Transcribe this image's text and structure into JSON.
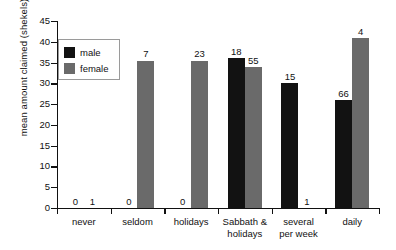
{
  "chart_data": {
    "type": "bar",
    "title": "",
    "xlabel": "",
    "ylabel": "mean amount claimed (shekels)",
    "ylim": [
      0,
      45
    ],
    "ytick_step": 5,
    "yticks": [
      45,
      40,
      35,
      30,
      25,
      20,
      15,
      10,
      5,
      0
    ],
    "grid": false,
    "legend_position": "inside-top-left",
    "categories": [
      "never",
      "seldom",
      "holidays",
      "Sabbath & holidays",
      "several per week",
      "daily"
    ],
    "series": [
      {
        "name": "male",
        "color": "#121212",
        "values": [
          0,
          0,
          0,
          36,
          30,
          26
        ],
        "labels": [
          "0",
          "0",
          "0",
          "18",
          "15",
          "66"
        ]
      },
      {
        "name": "female",
        "color": "#6a6a6a",
        "values": [
          0,
          35.5,
          35.5,
          34,
          0,
          41
        ],
        "labels": [
          "1",
          "7",
          "23",
          "55",
          "1",
          "4"
        ]
      }
    ]
  },
  "legend": {
    "items": [
      {
        "label": "male",
        "swatch": "male"
      },
      {
        "label": "female",
        "swatch": "female"
      }
    ]
  },
  "axis": {
    "y_title": "mean amount claimed (shekels)",
    "y_labels": [
      "45",
      "40",
      "35",
      "30",
      "25",
      "20",
      "15",
      "10",
      "5",
      "0"
    ],
    "x_labels": [
      [
        "never"
      ],
      [
        "seldom"
      ],
      [
        "holidays"
      ],
      [
        "Sabbath &",
        "holidays"
      ],
      [
        "several",
        "per week"
      ],
      [
        "daily"
      ]
    ]
  }
}
